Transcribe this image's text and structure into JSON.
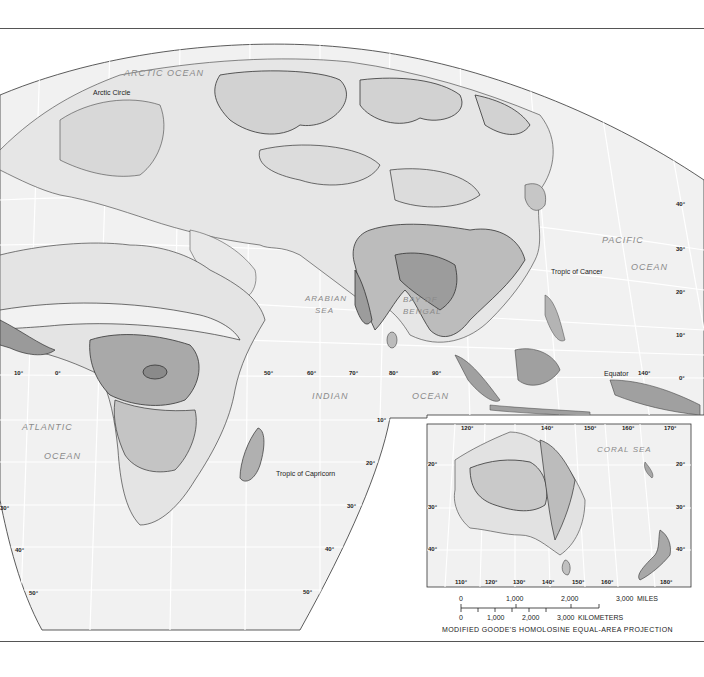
{
  "map": {
    "title_region": "Eurasia, Africa and Australia — vegetation/climate zones",
    "colors": {
      "ocean": "#f2f2f2",
      "land_light": "#e6e6e6",
      "land_mid": "#cfcfcf",
      "land_dark": "#a8a8a8",
      "land_darkest": "#8c8c8c",
      "graticule": "#ffffff",
      "outline": "#333333"
    },
    "oceans": [
      {
        "id": "arctic",
        "label": "ARCTIC OCEAN"
      },
      {
        "id": "atlantic1",
        "label": "ATLANTIC"
      },
      {
        "id": "atlantic2",
        "label": "OCEAN"
      },
      {
        "id": "indian1",
        "label": "INDIAN"
      },
      {
        "id": "indian2",
        "label": "OCEAN"
      },
      {
        "id": "pacific1",
        "label": "PACIFIC"
      },
      {
        "id": "pacific2",
        "label": "OCEAN"
      },
      {
        "id": "arabian1",
        "label": "ARABIAN"
      },
      {
        "id": "arabian2",
        "label": "SEA"
      },
      {
        "id": "bengal1",
        "label": "BAY OF"
      },
      {
        "id": "bengal2",
        "label": "BENGAL"
      },
      {
        "id": "coral",
        "label": "CORAL  SEA"
      }
    ],
    "lines": {
      "arctic_circle": "Arctic Circle",
      "tropic_cancer": "Tropic of Cancer",
      "equator": "Equator",
      "tropic_capricorn": "Tropic of Capricorn"
    },
    "longitudes_equator": [
      "10°",
      "0°",
      "50°",
      "60°",
      "70°",
      "80°",
      "90°",
      "140°"
    ],
    "latitudes_right": [
      "40°",
      "30°",
      "20°",
      "10°",
      "0°"
    ],
    "latitudes_indian_edge": [
      "10°",
      "20°",
      "30°",
      "40°",
      "50°"
    ],
    "latitudes_left": [
      "30°",
      "40°",
      "50°"
    ],
    "inset": {
      "top_longitudes": [
        "120°",
        "140°",
        "150°",
        "160°",
        "170°"
      ],
      "bottom_longitudes": [
        "110°",
        "120°",
        "130°",
        "140°",
        "150°",
        "160°",
        "180°"
      ],
      "left_latitudes": [
        "20°",
        "30°",
        "40°"
      ],
      "right_latitudes": [
        "20°",
        "30°",
        "40°"
      ]
    },
    "scale": {
      "miles_ticks": [
        "0",
        "1,000",
        "2,000",
        "3,000"
      ],
      "miles_unit": "MILES",
      "km_ticks": [
        "0",
        "1,000",
        "2,000",
        "3,000"
      ],
      "km_unit": "KILOMETERS"
    },
    "projection": "MODIFIED GOODE'S HOMOLOSINE EQUAL-AREA PROJECTION"
  }
}
